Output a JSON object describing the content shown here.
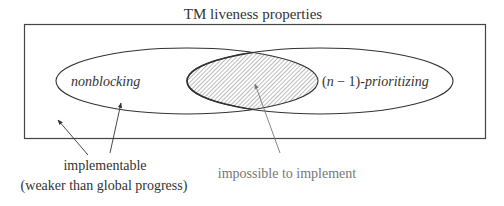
{
  "title": "TM liveness properties",
  "sets": {
    "left": {
      "label": "nonblocking"
    },
    "right": {
      "label_prefix": "(",
      "label_var": "n",
      "label_mid": " − 1)-",
      "label_suffix": "prioritizing"
    }
  },
  "intersection": {
    "label": "impossible to implement"
  },
  "outside": {
    "label_line1": "implementable",
    "label_line2": "(weaker than global progress)"
  },
  "colors": {
    "stroke": "#333333",
    "hatch": "#666666",
    "text": "#333333",
    "muted_text": "#777777",
    "arrow_gray": "#888888"
  }
}
